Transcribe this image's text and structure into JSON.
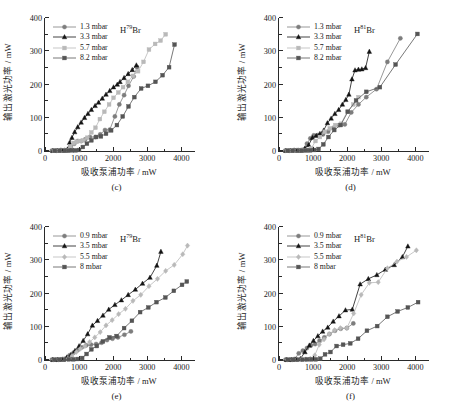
{
  "figure": {
    "axis": {
      "xlabel": "吸收泵浦功率 / mW",
      "ylabel": "输出激光功率 / mW",
      "xticks": [
        "0",
        "1000",
        "2000",
        "3000",
        "4000"
      ],
      "yticks": [
        "0",
        "100",
        "200",
        "300",
        "400"
      ],
      "xlim": [
        0,
        4400
      ],
      "ylim": [
        0,
        400
      ]
    },
    "colors": {
      "series1": "#7d7d7d",
      "series2": "#141414",
      "series3": "#b9b9b9",
      "series4": "#555555",
      "axis": "#2a2a2a"
    }
  },
  "chart_data": [
    {
      "type": "line",
      "panel": "(c)",
      "title": "H79Br",
      "species_pre": "H",
      "species_sup": "79",
      "species_post": "Br",
      "xlabel": "吸收泵浦功率 / mW",
      "ylabel": "输出激光功率 / mW",
      "xlim": [
        0,
        4400
      ],
      "ylim": [
        0,
        400
      ],
      "grid": false,
      "legend_position": "top-left",
      "series": [
        {
          "name": "1.3 mbar",
          "marker": "circle",
          "color": "#7d7d7d",
          "x": [
            200,
            330,
            450,
            560,
            660,
            760,
            860,
            960,
            1060,
            1180,
            1320,
            1480,
            1620,
            1760,
            1900,
            2050,
            2180,
            2320,
            2450,
            2600,
            2700
          ],
          "y": [
            1,
            1,
            2,
            2,
            3,
            12,
            22,
            30,
            30,
            35,
            42,
            42,
            50,
            63,
            64,
            104,
            140,
            168,
            196,
            224,
            252
          ]
        },
        {
          "name": "3.3 mbar",
          "marker": "triangle",
          "color": "#141414",
          "x": [
            230,
            360,
            470,
            580,
            660,
            720,
            790,
            870,
            960,
            1060,
            1160,
            1260,
            1360,
            1470,
            1570,
            1680,
            1790,
            1900,
            2010,
            2120,
            2200,
            2320,
            2440,
            2560,
            2680
          ],
          "y": [
            1,
            1,
            2,
            2,
            5,
            25,
            40,
            57,
            72,
            86,
            100,
            112,
            124,
            136,
            146,
            158,
            170,
            181,
            192,
            200,
            208,
            220,
            232,
            244,
            258
          ]
        },
        {
          "name": "5.7 mbar",
          "marker": "square",
          "color": "#b9b9b9",
          "x": [
            260,
            400,
            520,
            630,
            740,
            840,
            930,
            1030,
            1130,
            1240,
            1360,
            1480,
            1610,
            1740,
            1880,
            2010,
            2150,
            2290,
            2430,
            2580,
            2730,
            2890,
            3050,
            3230,
            3390,
            3540
          ],
          "y": [
            1,
            1,
            2,
            2,
            14,
            24,
            28,
            30,
            32,
            40,
            56,
            70,
            96,
            118,
            140,
            160,
            176,
            192,
            208,
            226,
            240,
            268,
            305,
            322,
            332,
            351
          ]
        },
        {
          "name": "8.2 mbar",
          "marker": "square",
          "color": "#555555",
          "x": [
            280,
            430,
            560,
            680,
            790,
            900,
            1000,
            1110,
            1230,
            1360,
            1500,
            1640,
            1790,
            1940,
            2110,
            2280,
            2450,
            2620,
            2820,
            3020,
            3240,
            3450,
            3640,
            3800
          ],
          "y": [
            1,
            1,
            1,
            1,
            2,
            2,
            3,
            12,
            22,
            32,
            42,
            44,
            52,
            62,
            78,
            104,
            134,
            162,
            188,
            196,
            208,
            228,
            252,
            320
          ]
        }
      ]
    },
    {
      "type": "line",
      "panel": "(d)",
      "title": "H81Br",
      "species_pre": "H",
      "species_sup": "81",
      "species_post": "Br",
      "xlabel": "吸收泵浦功率 / mW",
      "ylabel": "输出激光功率 / mW",
      "xlim": [
        0,
        4400
      ],
      "ylim": [
        0,
        400
      ],
      "grid": false,
      "legend_position": "top-left",
      "series": [
        {
          "name": "1.3 mbar",
          "marker": "circle",
          "color": "#7d7d7d",
          "x": [
            180,
            300,
            420,
            520,
            620,
            720,
            820,
            920,
            1020,
            1140,
            1290,
            1440,
            1600,
            1760,
            1930,
            2120,
            2330,
            2560,
            2860,
            3180,
            3560
          ],
          "y": [
            1,
            1,
            2,
            2,
            2,
            4,
            22,
            38,
            47,
            48,
            50,
            58,
            70,
            78,
            80,
            116,
            140,
            162,
            186,
            268,
            339
          ]
        },
        {
          "name": "3.3 mbar",
          "marker": "triangle",
          "color": "#141414",
          "x": [
            200,
            330,
            450,
            560,
            660,
            760,
            870,
            980,
            1090,
            1200,
            1310,
            1420,
            1530,
            1640,
            1750,
            1860,
            1960,
            2050,
            2140,
            2230,
            2330,
            2430,
            2540,
            2650
          ],
          "y": [
            1,
            1,
            2,
            2,
            2,
            8,
            18,
            40,
            46,
            52,
            62,
            84,
            98,
            112,
            124,
            140,
            154,
            170,
            216,
            243,
            245,
            246,
            250,
            299
          ]
        },
        {
          "name": "5.7 mbar",
          "marker": "square",
          "color": "#b9b9b9",
          "x": [
            230,
            370,
            500,
            620,
            730,
            840,
            950,
            1070,
            1200,
            1340,
            1490,
            1650,
            1820,
            2000,
            2180,
            2330
          ],
          "y": [
            1,
            1,
            1,
            2,
            2,
            2,
            8,
            30,
            42,
            58,
            68,
            78,
            82,
            118,
            140,
            162
          ]
        },
        {
          "name": "8.2 mbar",
          "marker": "square",
          "color": "#555555",
          "x": [
            250,
            400,
            540,
            670,
            790,
            910,
            1030,
            1160,
            1300,
            1450,
            1620,
            1810,
            2020,
            2260,
            2560,
            2960,
            3420,
            4060
          ],
          "y": [
            1,
            1,
            1,
            1,
            2,
            2,
            3,
            6,
            20,
            42,
            63,
            78,
            118,
            152,
            178,
            192,
            260,
            352
          ]
        }
      ]
    },
    {
      "type": "line",
      "panel": "(e)",
      "title": "H79Br",
      "species_pre": "H",
      "species_sup": "79",
      "species_post": "Br",
      "xlabel": "吸收泵浦功率 / mW",
      "ylabel": "输出激光功率 / mW",
      "xlim": [
        0,
        4400
      ],
      "ylim": [
        0,
        400
      ],
      "grid": false,
      "legend_position": "top-left",
      "series": [
        {
          "name": "0.9 mbar",
          "marker": "circle",
          "color": "#7d7d7d",
          "x": [
            200,
            340,
            470,
            600,
            720,
            840,
            960,
            1080,
            1210,
            1350,
            1500,
            1660,
            1820,
            1980,
            2140,
            2330,
            2520
          ],
          "y": [
            1,
            1,
            2,
            4,
            14,
            22,
            30,
            38,
            44,
            46,
            48,
            52,
            60,
            64,
            68,
            76,
            86
          ]
        },
        {
          "name": "3.5 mbar",
          "marker": "triangle",
          "color": "#141414",
          "x": [
            230,
            380,
            520,
            640,
            760,
            880,
            1000,
            1120,
            1250,
            1390,
            1540,
            1700,
            1870,
            2050,
            2240,
            2440,
            2650,
            2860,
            3080,
            3280,
            3400
          ],
          "y": [
            1,
            1,
            2,
            8,
            16,
            28,
            42,
            58,
            78,
            104,
            118,
            134,
            152,
            166,
            180,
            196,
            212,
            230,
            248,
            284,
            326
          ]
        },
        {
          "name": "5.5 mbar",
          "marker": "diamond",
          "color": "#b9b9b9",
          "x": [
            250,
            400,
            540,
            670,
            790,
            920,
            1040,
            1170,
            1310,
            1460,
            1620,
            1790,
            1970,
            2160,
            2360,
            2580,
            2810,
            3050,
            3300,
            3540,
            3790,
            4040,
            4180
          ],
          "y": [
            1,
            1,
            2,
            4,
            12,
            24,
            34,
            42,
            54,
            68,
            84,
            104,
            120,
            138,
            154,
            178,
            196,
            222,
            244,
            268,
            286,
            318,
            344
          ]
        },
        {
          "name": "8 mbar",
          "marker": "square",
          "color": "#555555",
          "x": [
            270,
            420,
            560,
            700,
            830,
            960,
            1090,
            1220,
            1360,
            1520,
            1700,
            1890,
            2100,
            2320,
            2550,
            2790,
            3030,
            3270,
            3530,
            3780,
            4020,
            4160
          ],
          "y": [
            1,
            1,
            1,
            2,
            2,
            3,
            6,
            18,
            32,
            42,
            56,
            68,
            72,
            96,
            118,
            144,
            158,
            174,
            188,
            208,
            226,
            236
          ]
        }
      ]
    },
    {
      "type": "line",
      "panel": "(f)",
      "title": "H81Br",
      "species_pre": "H",
      "species_sup": "81",
      "species_post": "Br",
      "xlabel": "吸收泵浦功率 / mW",
      "ylabel": "输出激光功率 / mW",
      "xlim": [
        0,
        4400
      ],
      "ylim": [
        0,
        400
      ],
      "grid": false,
      "legend_position": "top-left",
      "series": [
        {
          "name": "0.9 mbar",
          "marker": "circle",
          "color": "#7d7d7d",
          "x": [
            190,
            330,
            460,
            580,
            700,
            820,
            940,
            1060,
            1190,
            1330,
            1480,
            1640,
            1810,
            1990,
            2180
          ],
          "y": [
            1,
            1,
            3,
            20,
            28,
            36,
            44,
            48,
            58,
            68,
            78,
            88,
            94,
            96,
            110
          ]
        },
        {
          "name": "3.5 mbar",
          "marker": "triangle",
          "color": "#141414",
          "x": [
            220,
            360,
            500,
            630,
            760,
            890,
            1010,
            1140,
            1280,
            1430,
            1590,
            1760,
            1950,
            2150,
            2380,
            2620,
            2870,
            3120,
            3380,
            3620,
            3780
          ],
          "y": [
            1,
            1,
            2,
            4,
            24,
            44,
            58,
            72,
            86,
            98,
            116,
            132,
            150,
            152,
            228,
            244,
            256,
            272,
            286,
            310,
            342
          ]
        },
        {
          "name": "5.5 mbar",
          "marker": "diamond",
          "color": "#b9b9b9",
          "x": [
            240,
            390,
            530,
            660,
            790,
            920,
            1050,
            1180,
            1320,
            1470,
            1630,
            1800,
            1990,
            2190,
            2410,
            2650,
            2910,
            3180,
            3460,
            3740,
            4030
          ],
          "y": [
            1,
            1,
            2,
            2,
            2,
            4,
            14,
            46,
            62,
            78,
            90,
            96,
            96,
            140,
            196,
            232,
            234,
            276,
            296,
            310,
            330
          ]
        },
        {
          "name": "8 mbar",
          "marker": "square",
          "color": "#555555",
          "x": [
            260,
            410,
            550,
            690,
            820,
            950,
            1080,
            1210,
            1350,
            1510,
            1690,
            1880,
            2090,
            2320,
            2580,
            2880,
            3180,
            3480,
            3780,
            4080
          ],
          "y": [
            1,
            1,
            1,
            1,
            2,
            2,
            2,
            4,
            17,
            24,
            42,
            46,
            50,
            64,
            88,
            102,
            130,
            146,
            158,
            174
          ]
        }
      ]
    }
  ]
}
